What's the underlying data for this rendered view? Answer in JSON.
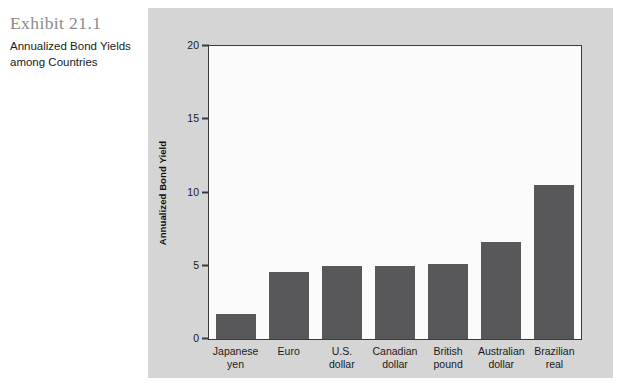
{
  "caption": {
    "exhibit_number": "Exhibit 21.1",
    "description": "Annualized Bond Yields among Countries"
  },
  "chart_data": {
    "type": "bar",
    "title": "Annualized Bond Yields among Countries",
    "xlabel": "",
    "ylabel": "Annualized Bond Yield",
    "ylim": [
      0,
      20
    ],
    "yticks": [
      0,
      5,
      10,
      15,
      20
    ],
    "ytick_labels": [
      "0",
      "5",
      "10",
      "15",
      "20"
    ],
    "grid": false,
    "legend": false,
    "bar_color": "#58585a",
    "plot_background": "#fbfbfb",
    "panel_background": "#d5d5d5",
    "categories": [
      "Japanese\nyen",
      "Euro",
      "U.S.\ndollar",
      "Canadian\ndollar",
      "British\npound",
      "Australian\ndollar",
      "Brazilian\nreal"
    ],
    "category_lines": [
      [
        "Japanese",
        "yen"
      ],
      [
        "Euro"
      ],
      [
        "U.S.",
        "dollar"
      ],
      [
        "Canadian",
        "dollar"
      ],
      [
        "British",
        "pound"
      ],
      [
        "Australian",
        "dollar"
      ],
      [
        "Brazilian",
        "real"
      ]
    ],
    "values": [
      1.7,
      4.6,
      5.0,
      5.0,
      5.1,
      6.6,
      10.5
    ]
  }
}
